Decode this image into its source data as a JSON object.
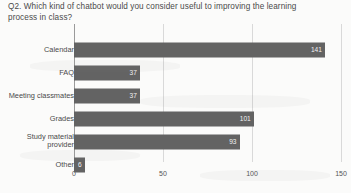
{
  "title": "Q2. Which kind of chatbot would you consider useful to improving the learning\nprocess in class?",
  "chart_data": {
    "type": "bar",
    "orientation": "horizontal",
    "title": "Q2. Which kind of chatbot would you consider useful to improving the learning process in class?",
    "xlabel": "",
    "ylabel": "",
    "categories": [
      "Calendar",
      "FAQ",
      "Meeting classmates",
      "Grades",
      "Study material\nprovider",
      "Other"
    ],
    "values": [
      141,
      37,
      37,
      101,
      93,
      6
    ],
    "value_labels": [
      "141",
      "37",
      "37",
      "101",
      "93",
      "6"
    ],
    "xlim": [
      0,
      150
    ],
    "xticks": [
      0,
      50,
      100,
      150
    ],
    "xtick_labels": [
      "0",
      "50",
      "100",
      "150"
    ],
    "grid": true,
    "legend": "none",
    "bar_color": "#636363",
    "value_label_color": "#f2f2f2",
    "background_color": "#fbfbfa"
  }
}
